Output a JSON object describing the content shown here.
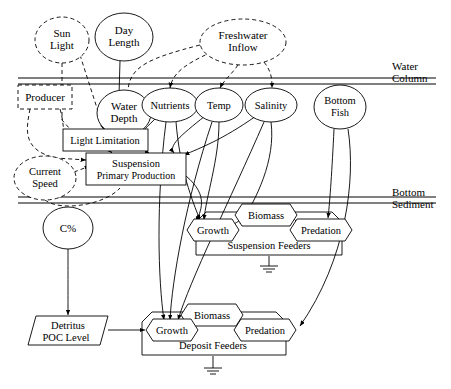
{
  "diagram": {
    "zones": [
      {
        "id": "water-column",
        "label": "Water\nColumn",
        "label_lines": [
          "Water",
          "Column"
        ],
        "x": 392,
        "y": 72
      },
      {
        "id": "bottom-sediment",
        "label_lines": [
          "Bottom",
          "Sediment"
        ],
        "x": 392,
        "y": 203
      }
    ],
    "ellipses": [
      {
        "id": "sun-light",
        "lines": [
          "Sun",
          "Light"
        ],
        "cx": 62,
        "cy": 40,
        "rx": 27,
        "ry": 23,
        "dashed": true
      },
      {
        "id": "day-length",
        "lines": [
          "Day",
          "Length"
        ],
        "cx": 124,
        "cy": 37,
        "rx": 29,
        "ry": 24,
        "dashed": false
      },
      {
        "id": "freshwater-inflow",
        "lines": [
          "Freshwater",
          "Inflow"
        ],
        "cx": 243,
        "cy": 42,
        "rx": 43,
        "ry": 23,
        "dashed": true
      },
      {
        "id": "water-depth",
        "lines": [
          "Water",
          "Depth"
        ],
        "cx": 124,
        "cy": 113,
        "rx": 27,
        "ry": 23,
        "dashed": false
      },
      {
        "id": "nutrients",
        "lines": [
          "Nutrients"
        ],
        "cx": 170,
        "cy": 105,
        "rx": 28,
        "ry": 17,
        "dashed": false
      },
      {
        "id": "temp",
        "lines": [
          "Temp"
        ],
        "cx": 219,
        "cy": 105,
        "rx": 24,
        "ry": 17,
        "dashed": false
      },
      {
        "id": "salinity",
        "lines": [
          "Salinity"
        ],
        "cx": 271,
        "cy": 105,
        "rx": 26,
        "ry": 17,
        "dashed": false
      },
      {
        "id": "bottom-fish",
        "lines": [
          "Bottom",
          "Fish"
        ],
        "cx": 340,
        "cy": 107,
        "rx": 26,
        "ry": 22,
        "dashed": false
      },
      {
        "id": "current-speed",
        "lines": [
          "Current",
          "Speed"
        ],
        "cx": 45,
        "cy": 178,
        "rx": 31,
        "ry": 22,
        "dashed": true
      },
      {
        "id": "c-percent",
        "lines": [
          "C%"
        ],
        "cx": 68,
        "cy": 228,
        "rx": 25,
        "ry": 21,
        "dashed": false
      }
    ],
    "boxes": [
      {
        "id": "producer",
        "label": "Producer",
        "x": 18,
        "y": 85,
        "w": 54,
        "h": 24,
        "dashed": true
      },
      {
        "id": "light-limitation",
        "label": "Light Limitation",
        "x": 63,
        "y": 129,
        "w": 85,
        "h": 22,
        "dashed": false
      },
      {
        "id": "suspension-primary-production",
        "lines": [
          "Suspension",
          "Primary Production"
        ],
        "x": 86,
        "y": 153,
        "w": 100,
        "h": 32,
        "dashed": false
      }
    ],
    "hexagons": [
      {
        "id": "growth-suspension",
        "label": "Growth",
        "cx": 213,
        "cy": 230,
        "w": 54,
        "h": 22
      },
      {
        "id": "biomass-suspension",
        "label": "Biomass",
        "cx": 266,
        "cy": 215,
        "w": 62,
        "h": 22
      },
      {
        "id": "predation-suspension",
        "label": "Predation",
        "cx": 322,
        "cy": 230,
        "w": 64,
        "h": 22
      },
      {
        "id": "growth-deposit",
        "label": "Growth",
        "cx": 172,
        "cy": 330,
        "w": 54,
        "h": 22
      },
      {
        "id": "biomass-deposit",
        "label": "Biomass",
        "cx": 212,
        "cy": 315,
        "w": 62,
        "h": 22
      },
      {
        "id": "predation-deposit",
        "label": "Predation",
        "cx": 265,
        "cy": 330,
        "w": 64,
        "h": 22
      }
    ],
    "compartments": [
      {
        "id": "suspension-feeders",
        "label": "Suspension Feeders",
        "cx": 269,
        "cy": 245
      },
      {
        "id": "deposit-feeders",
        "label": "Deposit Feeders",
        "cx": 213,
        "cy": 345
      }
    ],
    "parallelograms": [
      {
        "id": "detritus-poc-level",
        "lines": [
          "Detritus",
          "POC Level"
        ],
        "cx": 68,
        "cy": 330,
        "w": 80,
        "h": 30
      }
    ],
    "ground_symbols": [
      {
        "id": "ground-suspension",
        "x": 269,
        "y": 268
      },
      {
        "id": "ground-deposit",
        "x": 213,
        "y": 370
      }
    ],
    "separators": [
      {
        "id": "water-column-line-top",
        "y": 78
      },
      {
        "id": "water-column-line-bottom",
        "y": 84
      },
      {
        "id": "sediment-line-top",
        "y": 197
      },
      {
        "id": "sediment-line-bottom",
        "y": 203
      }
    ]
  }
}
